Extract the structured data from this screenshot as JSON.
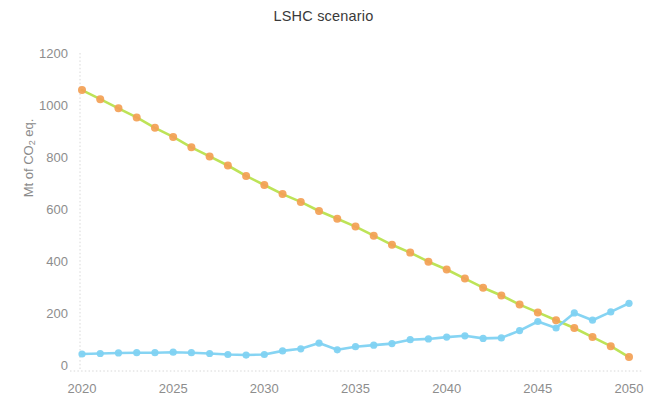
{
  "chart_data": {
    "type": "line",
    "title": "LSHC scenario",
    "xlabel": "",
    "ylabel": "Mt of CO2 eq.",
    "ylabel_rich": "Mt of CO₂ eq.",
    "xlim": [
      2019.2,
      2050.4
    ],
    "ylim": [
      0,
      1250
    ],
    "yticks": [
      0,
      200,
      400,
      600,
      800,
      1000,
      1200
    ],
    "ytick_labels": [
      "0",
      "200",
      "400",
      "600",
      "800",
      "1000",
      "1200"
    ],
    "xticks": [
      2020,
      2025,
      2030,
      2035,
      2040,
      2045,
      2050
    ],
    "xtick_labels": [
      "2020",
      "2025",
      "2030",
      "2035",
      "2040",
      "2045",
      "2050"
    ],
    "grid": false,
    "legend": "none",
    "x": [
      2020,
      2021,
      2022,
      2023,
      2024,
      2025,
      2026,
      2027,
      2028,
      2029,
      2030,
      2031,
      2032,
      2033,
      2034,
      2035,
      2036,
      2037,
      2038,
      2039,
      2040,
      2041,
      2042,
      2043,
      2044,
      2045,
      2046,
      2047,
      2048,
      2049,
      2050
    ],
    "series": [
      {
        "name": "emissions-decline",
        "line_color": "#b9e24e",
        "marker_color": "#f3a055",
        "marker": "circle",
        "values": [
          1065,
          1030,
          995,
          960,
          920,
          885,
          845,
          810,
          775,
          735,
          700,
          665,
          635,
          600,
          570,
          540,
          505,
          470,
          440,
          405,
          375,
          340,
          305,
          275,
          240,
          210,
          180,
          150,
          115,
          80,
          38
        ]
      },
      {
        "name": "removals-ramp",
        "line_color": "#7fd2f2",
        "marker_color": "#7fd2f2",
        "marker": "circle",
        "values": [
          50,
          52,
          54,
          55,
          55,
          57,
          55,
          52,
          48,
          46,
          48,
          62,
          70,
          92,
          66,
          78,
          84,
          90,
          105,
          108,
          115,
          120,
          110,
          112,
          140,
          175,
          150,
          208,
          180,
          212,
          245
        ]
      }
    ],
    "crossover": {
      "year": 2047,
      "value": 195
    }
  },
  "accent_colors": {
    "green": "#b9e24e",
    "orange": "#f3a055",
    "blue": "#7fd2f2",
    "axis": "#d8d8d8",
    "tick_text": "#8d8d8d",
    "title_text": "#3a3a3a",
    "background": "#ffffff"
  }
}
